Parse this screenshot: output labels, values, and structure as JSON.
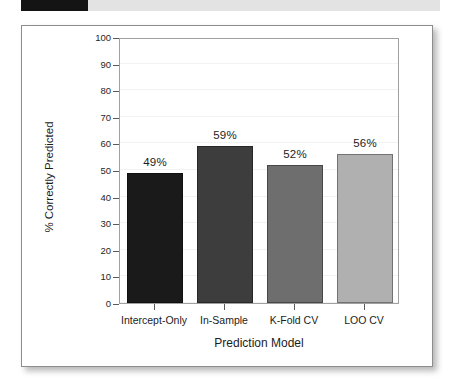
{
  "header": {
    "redaction_label": "",
    "strip_color": "#e3e3e3",
    "redaction_color": "#141414"
  },
  "chart_data": {
    "type": "bar",
    "title": "",
    "xlabel": "Prediction Model",
    "ylabel": "% Correctly Predicted",
    "categories": [
      "Intercept-Only",
      "In-Sample",
      "K-Fold CV",
      "LOO CV"
    ],
    "values": [
      49,
      59,
      52,
      56
    ],
    "data_labels": [
      "49%",
      "59%",
      "52%",
      "56%"
    ],
    "bar_colors": [
      "#1a1a1a",
      "#3d3d3d",
      "#6e6e6e",
      "#b0b0b0"
    ],
    "ylim": [
      0,
      100
    ],
    "yticks": [
      0,
      10,
      20,
      30,
      40,
      50,
      60,
      70,
      80,
      90,
      100
    ],
    "ytick_labels": [
      "0",
      "10",
      "20",
      "30",
      "40",
      "50",
      "60",
      "70",
      "80",
      "90",
      "100"
    ],
    "grid": true,
    "grid_color": "#f2f2f2",
    "legend": false,
    "panel_border_color": "#a0a0a0"
  }
}
